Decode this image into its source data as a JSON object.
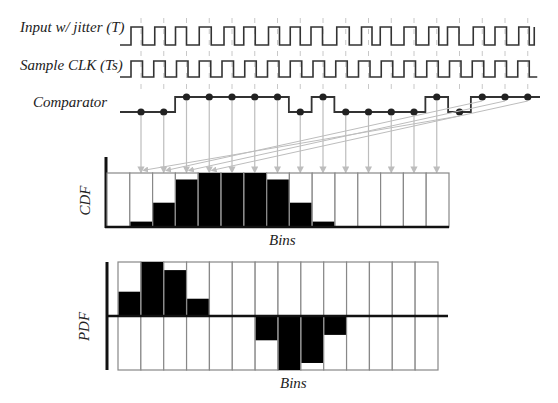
{
  "signals": {
    "input_label": "Input w/ jitter (T)",
    "clk_label": "Sample CLK (Ts)",
    "comparator_label": "Comparator"
  },
  "cdf": {
    "ylabel": "CDF",
    "xlabel": "Bins"
  },
  "pdf": {
    "ylabel": "PDF",
    "xlabel": "Bins"
  },
  "colors": {
    "wave": "#333333",
    "guide": "#c8c8c8",
    "arrow": "#bdbdbd",
    "fill": "#000000",
    "grid": "#888888"
  },
  "chart_data": [
    {
      "type": "bar",
      "title": "CDF",
      "xlabel": "Bins",
      "ylabel": "CDF",
      "categories": [
        "1",
        "2",
        "3",
        "4",
        "5",
        "6",
        "7",
        "8",
        "9",
        "10",
        "11",
        "12",
        "13",
        "14",
        "15"
      ],
      "values": [
        0,
        0.1,
        0.45,
        0.88,
        1.0,
        1.0,
        1.0,
        0.88,
        0.45,
        0.1,
        0,
        0,
        0,
        0,
        0
      ],
      "ylim": [
        0,
        1
      ]
    },
    {
      "type": "bar",
      "title": "PDF",
      "xlabel": "Bins",
      "ylabel": "PDF",
      "categories": [
        "1",
        "2",
        "3",
        "4",
        "5",
        "6",
        "7",
        "8",
        "9",
        "10",
        "11",
        "12",
        "13",
        "14"
      ],
      "values": [
        0.45,
        1.0,
        0.85,
        0.32,
        0,
        0,
        -0.45,
        -1.0,
        -0.87,
        -0.35,
        0,
        0,
        0,
        0
      ],
      "ylim": [
        -1,
        1
      ]
    }
  ],
  "comparator_samples": [
    0,
    0,
    1,
    1,
    1,
    1,
    1,
    0,
    1,
    0,
    0,
    0,
    0,
    1,
    0,
    1,
    1,
    1
  ]
}
